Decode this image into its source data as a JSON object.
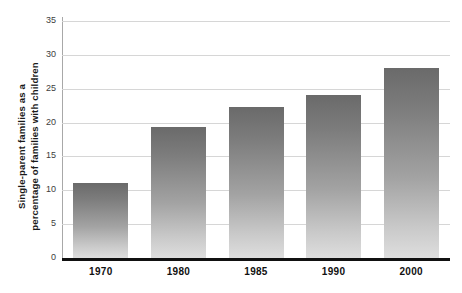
{
  "chart_data": {
    "type": "bar",
    "title": "",
    "xlabel": "",
    "ylabel": "Single-parent families as a percentage of families with children",
    "ylabel_lines": [
      "Single-parent families as a",
      "percentage of families with children"
    ],
    "categories": [
      "1970",
      "1980",
      "1985",
      "1990",
      "2000"
    ],
    "values": [
      11.1,
      19.3,
      22.3,
      24.1,
      28.0
    ],
    "ylim": [
      0,
      35
    ],
    "yticks": [
      0,
      5,
      10,
      15,
      20,
      25,
      30,
      35
    ],
    "ytick_labels": [
      "0",
      "5",
      "10",
      "15",
      "20",
      "25",
      "30",
      "35"
    ],
    "grid": true,
    "legend": null,
    "colors": {
      "bar_gradient_top": "#6a6a6a",
      "bar_gradient_bottom": "#dedede",
      "gridline": "#d6d6d6",
      "axis_line": "#111111",
      "text": "#111111",
      "background": "#ffffff"
    }
  }
}
